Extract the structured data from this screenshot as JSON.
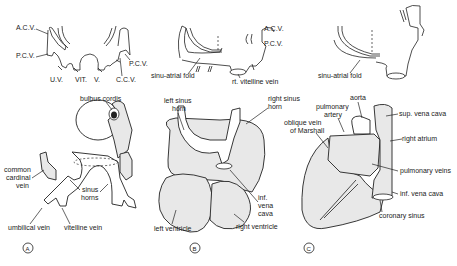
{
  "figure": {
    "top_row": {
      "left": {
        "labels": {
          "acv": "A.C.V.",
          "pcv_left": "P.C.V.",
          "pcv_right": "P.C.V.",
          "uv": "U.V.",
          "vit": "VIT.",
          "v": "V.",
          "ccv": "C.C.V."
        }
      },
      "middle": {
        "labels": {
          "acv": "A.C.V.",
          "pcv": "P.C.V.",
          "sinu_atrial_fold": "sinu-atrial fold",
          "rt_vitelline_vein": "rt. vitelline vein"
        }
      },
      "right": {
        "labels": {
          "sinu_atrial_fold": "sinu-atrial fold"
        }
      }
    },
    "panels": [
      {
        "id": "A",
        "labels": {
          "bulbus_cordis": "bulbus cordis",
          "common_cardinal_vein_1": "common",
          "common_cardinal_vein_2": "cardinal",
          "common_cardinal_vein_3": "vein",
          "sinus_horns_1": "sinus",
          "sinus_horns_2": "horns",
          "umbilical_vein": "umbilical vein",
          "vitelline_vein": "vitelline vein"
        }
      },
      {
        "id": "B",
        "labels": {
          "left_sinus_horn_1": "left sinus",
          "left_sinus_horn_2": "horn",
          "right_sinus_horn_1": "right sinus",
          "right_sinus_horn_2": "horn",
          "inf_vena_cava_1": "inf.",
          "inf_vena_cava_2": "vena",
          "inf_vena_cava_3": "cava",
          "left_ventricle": "left ventricle",
          "right_ventricle": "right ventricle"
        }
      },
      {
        "id": "C",
        "labels": {
          "aorta": "aorta",
          "pulmonary_artery_1": "pulmonary",
          "pulmonary_artery_2": "artery",
          "oblique_vein_1": "oblique vein",
          "oblique_vein_2": "of Marshall",
          "sup_vena_cava": "sup. vena cava",
          "right_atrium": "right atrium",
          "pulmonary_veins": "pulmonary veins",
          "inf_vena_cava": "inf. vena cava",
          "coronary_sinus": "coronary sinus"
        }
      }
    ]
  }
}
